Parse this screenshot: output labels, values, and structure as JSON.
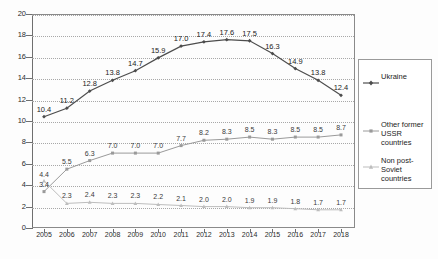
{
  "chart_data": {
    "type": "line",
    "title": "",
    "subtitle": "",
    "xlabel": "",
    "ylabel": "",
    "categories": [
      "2005",
      "2006",
      "2007",
      "2008",
      "2009",
      "2010",
      "2011",
      "2012",
      "2013",
      "2014",
      "2015",
      "2016",
      "2017",
      "2018"
    ],
    "ylim": [
      0,
      20
    ],
    "ytick_labels": [
      "0",
      "2",
      "4",
      "6",
      "8",
      "10",
      "12",
      "14",
      "16",
      "18",
      "20"
    ],
    "ytick_values": [
      0,
      2,
      4,
      6,
      8,
      10,
      12,
      14,
      16,
      18,
      20
    ],
    "grid": "horizontal-dotted",
    "legend_position": "right",
    "series": [
      {
        "name": "Ukraine",
        "color": "#4d4d4d",
        "marker": "diamond",
        "values": [
          10.4,
          11.2,
          12.8,
          13.8,
          14.7,
          15.9,
          17.0,
          17.4,
          17.6,
          17.5,
          16.3,
          14.9,
          13.8,
          12.4
        ],
        "labels": [
          "10.4",
          "11.2",
          "12.8",
          "13.8",
          "14.7",
          "15.9",
          "17.0",
          "17.4",
          "17.6",
          "17.5",
          "16.3",
          "14.9",
          "13.8",
          "12.4"
        ]
      },
      {
        "name": "Other former USSR countries",
        "color": "#9a9a9a",
        "marker": "square",
        "values": [
          3.4,
          5.5,
          6.3,
          7.0,
          7.0,
          7.0,
          7.7,
          8.2,
          8.3,
          8.5,
          8.3,
          8.5,
          8.5,
          8.7
        ],
        "labels": [
          "3.4",
          "5.5",
          "6.3",
          "7.0",
          "7.0",
          "7.0",
          "7.7",
          "8.2",
          "8.3",
          "8.5",
          "8.3",
          "8.5",
          "8.5",
          "8.7"
        ]
      },
      {
        "name": "Non post-Soviet countries",
        "color": "#bdbdbd",
        "marker": "triangle",
        "values": [
          4.4,
          2.3,
          2.4,
          2.3,
          2.3,
          2.2,
          2.1,
          2.0,
          2.0,
          1.9,
          1.9,
          1.8,
          1.7,
          1.7
        ],
        "labels": [
          "4.4",
          "2.3",
          "2.4",
          "2.3",
          "2.3",
          "2.2",
          "2.1",
          "2.0",
          "2.0",
          "1.9",
          "1.9",
          "1.8",
          "1.7",
          "1.7"
        ]
      }
    ]
  },
  "legend": {
    "entries": [
      {
        "label": "Ukraine"
      },
      {
        "label": "Other former USSR countries"
      },
      {
        "label": "Non post-Soviet countries"
      }
    ]
  }
}
